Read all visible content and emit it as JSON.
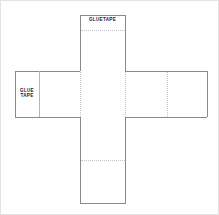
{
  "document": {
    "title": "Cube Net Template",
    "type": "papercraft-cube-net",
    "background_color": "#ffffff",
    "line_color": "#8a8a8a",
    "fold_line_color": "#c4c4c4",
    "text_color": "#1a1a1a",
    "border_color": "#e2e2e2"
  },
  "labels": {
    "glue_tab_top": "GLUETAPE",
    "glue_tab_left": "GLUE\nTAPE"
  },
  "net": {
    "shape": "cross",
    "vertical_strip": {
      "x1": 79,
      "x2": 124,
      "y1": 14,
      "y2": 202
    },
    "horizontal_band": {
      "x1": 14,
      "x2": 206,
      "y1": 70,
      "y2": 116
    },
    "tabs": [
      {
        "name": "top-glue-tab",
        "x1": 79,
        "x2": 124,
        "y1": 14,
        "y2": 29
      },
      {
        "name": "left-glue-tab",
        "x1": 14,
        "x2": 38,
        "y1": 70,
        "y2": 116
      }
    ],
    "fold_lines": [
      {
        "name": "top-tab-fold",
        "orientation": "horizontal",
        "y": 29,
        "x1": 79,
        "x2": 124
      },
      {
        "name": "left-tab-fold",
        "orientation": "vertical",
        "x": 38,
        "y1": 70,
        "y2": 116
      },
      {
        "name": "right-panel-fold",
        "orientation": "vertical",
        "x": 166,
        "y1": 70,
        "y2": 116
      },
      {
        "name": "bottom-panel-fold",
        "orientation": "horizontal",
        "y": 159,
        "x1": 79,
        "x2": 124
      },
      {
        "name": "center-left-fold",
        "orientation": "vertical",
        "x": 79,
        "y1": 70,
        "y2": 116
      },
      {
        "name": "center-right-fold",
        "orientation": "vertical",
        "x": 124,
        "y1": 70,
        "y2": 116
      }
    ],
    "panels": [
      {
        "name": "panel-top",
        "x1": 79,
        "x2": 124,
        "y1": 29,
        "y2": 70
      },
      {
        "name": "panel-center",
        "x1": 79,
        "x2": 124,
        "y1": 70,
        "y2": 116
      },
      {
        "name": "panel-bottom",
        "x1": 79,
        "x2": 124,
        "y1": 116,
        "y2": 202
      },
      {
        "name": "panel-left",
        "x1": 38,
        "x2": 79,
        "y1": 70,
        "y2": 116
      },
      {
        "name": "panel-right",
        "x1": 124,
        "x2": 166,
        "y1": 70,
        "y2": 116
      },
      {
        "name": "panel-far-right",
        "x1": 166,
        "x2": 206,
        "y1": 70,
        "y2": 116
      }
    ]
  }
}
